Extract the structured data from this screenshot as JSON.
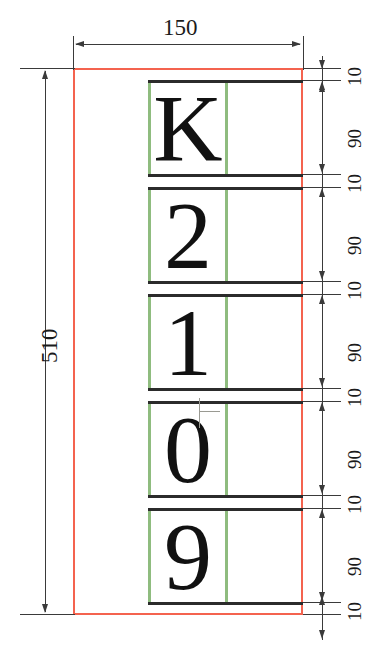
{
  "drawing": {
    "title": "License plate character layout dimension drawing",
    "units": "mm",
    "plate": {
      "width_label": "150",
      "height_label": "510",
      "border_color": "#f4634f"
    },
    "cell_border_color": "#8fbc7f",
    "characters": [
      {
        "label": "K",
        "height_label": "90"
      },
      {
        "label": "2",
        "height_label": "90"
      },
      {
        "label": "1",
        "height_label": "90"
      },
      {
        "label": "0",
        "height_label": "90"
      },
      {
        "label": "9",
        "height_label": "90"
      }
    ],
    "gaps": [
      {
        "label": "10"
      },
      {
        "label": "10"
      },
      {
        "label": "10"
      },
      {
        "label": "10"
      },
      {
        "label": "10"
      },
      {
        "label": "10"
      }
    ],
    "right_dimension_stack": [
      "10",
      "90",
      "10",
      "90",
      "10",
      "90",
      "10",
      "90",
      "10"
    ]
  }
}
